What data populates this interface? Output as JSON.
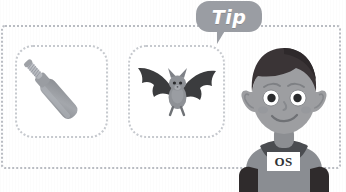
{
  "page": {
    "background_color": "#ffffff"
  },
  "frame": {
    "name": "dotted-outer-frame",
    "border_color": "#b9bcc2",
    "style": "dotted"
  },
  "speech_bubble": {
    "label": "Tip",
    "fill_color": "#9a9da3",
    "text_color": "#ffffff"
  },
  "panels": [
    {
      "id": "bat-object",
      "icon": "cricket-bat-icon",
      "description": "cricket bat",
      "border_color": "#c6c9ce",
      "blade_color": "#9b9ea3",
      "handle_color": "#b6b9be"
    },
    {
      "id": "bat-animal",
      "icon": "bat-animal-icon",
      "description": "bat flying",
      "border_color": "#c6c9ce",
      "wing_color": "#3b3c3e",
      "body_color": "#8e9196"
    }
  ],
  "character": {
    "name": "elf-boy-character",
    "hair_color": "#3a3436",
    "skin_color": "#9d9ea1",
    "shirt_color": "#8a8d92",
    "collar_color": "#4a4c50",
    "eye_white": "#ffffff",
    "pupil_color": "#2a2b2d"
  },
  "badge": {
    "label": "OS",
    "background_color": "#ffffff",
    "text_color": "#2f3236"
  }
}
